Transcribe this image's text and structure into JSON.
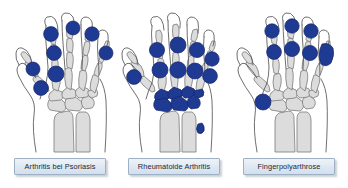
{
  "figure": {
    "background_color": "#ffffff",
    "marker_color": "#1f3a93",
    "marker_stroke_color": "#15266b",
    "bone_fill_color": "#dcdcdc",
    "bone_stroke_color": "#7a7a7a",
    "skin_outline_color": "#555555",
    "label_background_color": "#dfe8f2",
    "label_border_color": "#9fb0c4",
    "label_text_color": "#1b2838"
  },
  "panels": [
    {
      "id": "arthritis-bei-psoriasis",
      "label": "Arthritis bei Psoriasis",
      "pattern_description": "Ray pattern: DIP, PIP and MCP joints of individual digits plus thumb IP and MCP",
      "marker_count": 9,
      "markers": [
        {
          "joint": "thumb-ip",
          "cx": 31,
          "cy": 66,
          "r": 7.0
        },
        {
          "joint": "thumb-mcp",
          "cx": 39,
          "cy": 85,
          "r": 7.4
        },
        {
          "joint": "index-dip",
          "cx": 49,
          "cy": 31,
          "r": 7.4
        },
        {
          "joint": "index-pip",
          "cx": 52,
          "cy": 50,
          "r": 7.4
        },
        {
          "joint": "index-mcp",
          "cx": 54,
          "cy": 71,
          "r": 8.0
        },
        {
          "joint": "middle-dip",
          "cx": 71,
          "cy": 25,
          "r": 7.0
        },
        {
          "joint": "ring-dip",
          "cx": 90,
          "cy": 31,
          "r": 7.2
        },
        {
          "joint": "ring-pip",
          "cx": 93,
          "cy": 47,
          "r": 0.0
        },
        {
          "joint": "little-pip",
          "cx": 104,
          "cy": 50,
          "r": 7.0
        }
      ]
    },
    {
      "id": "rheumatoide-arthritis",
      "label": "Rheumatoide Arthritis",
      "pattern_description": "Symmetric proximal pattern: MCP and PIP joints of all digits, carpal bones and ulnar styloid; DIP joints spared",
      "marker_count": 12,
      "markers": [
        {
          "joint": "thumb-mcp",
          "cx": 18,
          "cy": 74,
          "r": 7.4
        },
        {
          "joint": "index-pip",
          "cx": 41,
          "cy": 47,
          "r": 7.6
        },
        {
          "joint": "index-mcp",
          "cx": 44,
          "cy": 67,
          "r": 8.0
        },
        {
          "joint": "middle-pip",
          "cx": 62,
          "cy": 42,
          "r": 8.0
        },
        {
          "joint": "middle-mcp",
          "cx": 62,
          "cy": 67,
          "r": 8.2
        },
        {
          "joint": "ring-pip",
          "cx": 81,
          "cy": 47,
          "r": 7.6
        },
        {
          "joint": "ring-mcp",
          "cx": 79,
          "cy": 68,
          "r": 8.0
        },
        {
          "joint": "little-pip",
          "cx": 96,
          "cy": 56,
          "r": 7.2
        },
        {
          "joint": "little-mcp",
          "cx": 94,
          "cy": 73,
          "r": 7.4
        },
        {
          "joint": "carpus",
          "cx": 62,
          "cy": 100,
          "r": 0.0
        },
        {
          "joint": "ulnar-styloid",
          "cx": 86,
          "cy": 126,
          "r": 5.2
        }
      ]
    },
    {
      "id": "fingerpolyarthrose",
      "label": "Fingerpolyarthrose",
      "pattern_description": "Distal pattern: DIP (Heberden) and PIP (Bouchard) joints of digits 2-5 plus thumb carpometacarpal joint",
      "marker_count": 9,
      "markers": [
        {
          "joint": "index-dip",
          "cx": 42,
          "cy": 28,
          "r": 7.2
        },
        {
          "joint": "index-pip",
          "cx": 44,
          "cy": 49,
          "r": 7.4
        },
        {
          "joint": "middle-dip",
          "cx": 62,
          "cy": 23,
          "r": 7.2
        },
        {
          "joint": "middle-pip",
          "cx": 62,
          "cy": 46,
          "r": 7.6
        },
        {
          "joint": "ring-dip",
          "cx": 81,
          "cy": 28,
          "r": 7.2
        },
        {
          "joint": "ring-pip",
          "cx": 80,
          "cy": 50,
          "r": 7.6
        },
        {
          "joint": "little-dip",
          "cx": 97,
          "cy": 46,
          "r": 6.6
        },
        {
          "joint": "little-pip",
          "cx": 98,
          "cy": 57,
          "r": 6.6
        },
        {
          "joint": "thumb-cmc",
          "cx": 33,
          "cy": 99,
          "r": 8.0
        }
      ]
    }
  ]
}
